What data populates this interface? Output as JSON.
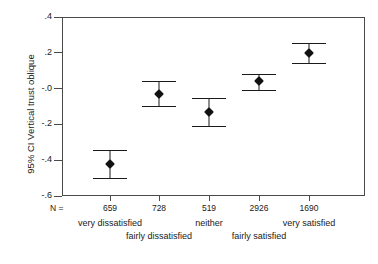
{
  "chart_data": {
    "type": "scatter",
    "title": "",
    "subtitle": "",
    "xlabel": "",
    "ylabel": "95% CI Vertical trust oblique",
    "categories": [
      "very dissatisfied",
      "fairly dissatisfied",
      "neither",
      "fairly satisfied",
      "very satisfied"
    ],
    "n_label": "N =",
    "n_values": [
      659,
      728,
      519,
      2926,
      1690
    ],
    "values": [
      -0.42,
      -0.03,
      -0.13,
      0.04,
      0.2
    ],
    "ci_lower": [
      -0.5,
      -0.1,
      -0.21,
      -0.01,
      0.145
    ],
    "ci_upper": [
      -0.345,
      0.045,
      -0.055,
      0.08,
      0.255
    ],
    "ytick_labels": [
      ".4",
      ".2",
      "-.0",
      "-.2",
      "-.4",
      "-.6"
    ],
    "ytick_values": [
      0.4,
      0.2,
      0.0,
      -0.2,
      -0.4,
      -0.6
    ],
    "ylim": [
      -0.6,
      0.4
    ],
    "grid": false,
    "legend": null,
    "marker_color": "#111111",
    "axis_color": "#4a4a4a",
    "error_bar_style": "95% confidence interval with horizontal caps"
  }
}
